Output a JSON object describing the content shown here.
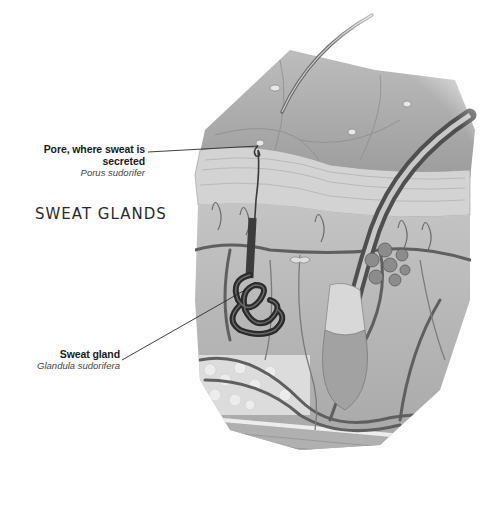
{
  "title": "SWEAT GLANDS",
  "labels": [
    {
      "id": "pore",
      "main": "Pore, where sweat is secreted",
      "latin": "Porus sudorifer"
    },
    {
      "id": "gland",
      "main": "Sweat gland",
      "latin": "Glandula sudorifera"
    }
  ],
  "colors": {
    "background": "#ffffff",
    "skin_surface": "#a9a9a9",
    "dermis": "#b8b8b8",
    "vessels": "#5a5a5a",
    "gland": "#2e2e2e",
    "text": "#1a1a1a"
  },
  "structures": [
    "hair",
    "skin-surface",
    "epidermis",
    "dermis",
    "sweat-duct",
    "sweat-gland-coil",
    "hair-follicle",
    "sebaceous-gland",
    "blood-vessels",
    "fat-tissue",
    "muscle-layer"
  ]
}
